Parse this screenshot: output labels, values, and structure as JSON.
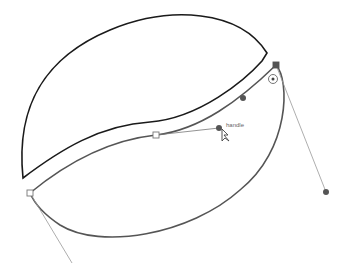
{
  "canvas": {
    "background": "#ffffff"
  },
  "shapes": {
    "upper_shape": {
      "description": "Closed upper half of bean shape",
      "stroke": "#1a1a1a"
    },
    "lower_shape": {
      "description": "Selected lower path being edited",
      "stroke": "#555555"
    }
  },
  "editing": {
    "tooltip_label": "handle",
    "anchor_point_color": "#ffffff",
    "handle_point_color": "#555555",
    "handle_line_color": "#999999",
    "cursor": "direct-selection-arrow-icon"
  }
}
